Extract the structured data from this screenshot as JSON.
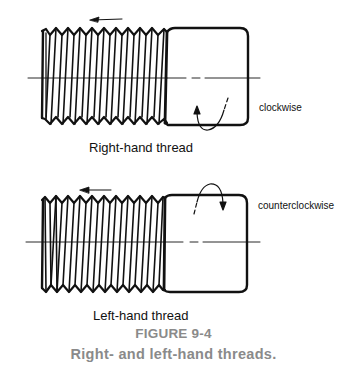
{
  "figure": {
    "number": "FIGURE 9-4",
    "caption": "Right- and left-hand threads.",
    "caption_color": "#8a8a8a"
  },
  "panels": [
    {
      "id": "right-hand",
      "title": "Right-hand thread",
      "rotation_label": "clockwise",
      "advance_direction": "left",
      "thread_slant": "right"
    },
    {
      "id": "left-hand",
      "title": "Left-hand thread",
      "rotation_label": "counterclockwise",
      "advance_direction": "left",
      "thread_slant": "left"
    }
  ],
  "icons": {
    "advance_arrow": "arrow-left-icon",
    "rotation_arrow": "curved-arrow-icon"
  },
  "colors": {
    "line": "#111111",
    "background": "#ffffff"
  }
}
